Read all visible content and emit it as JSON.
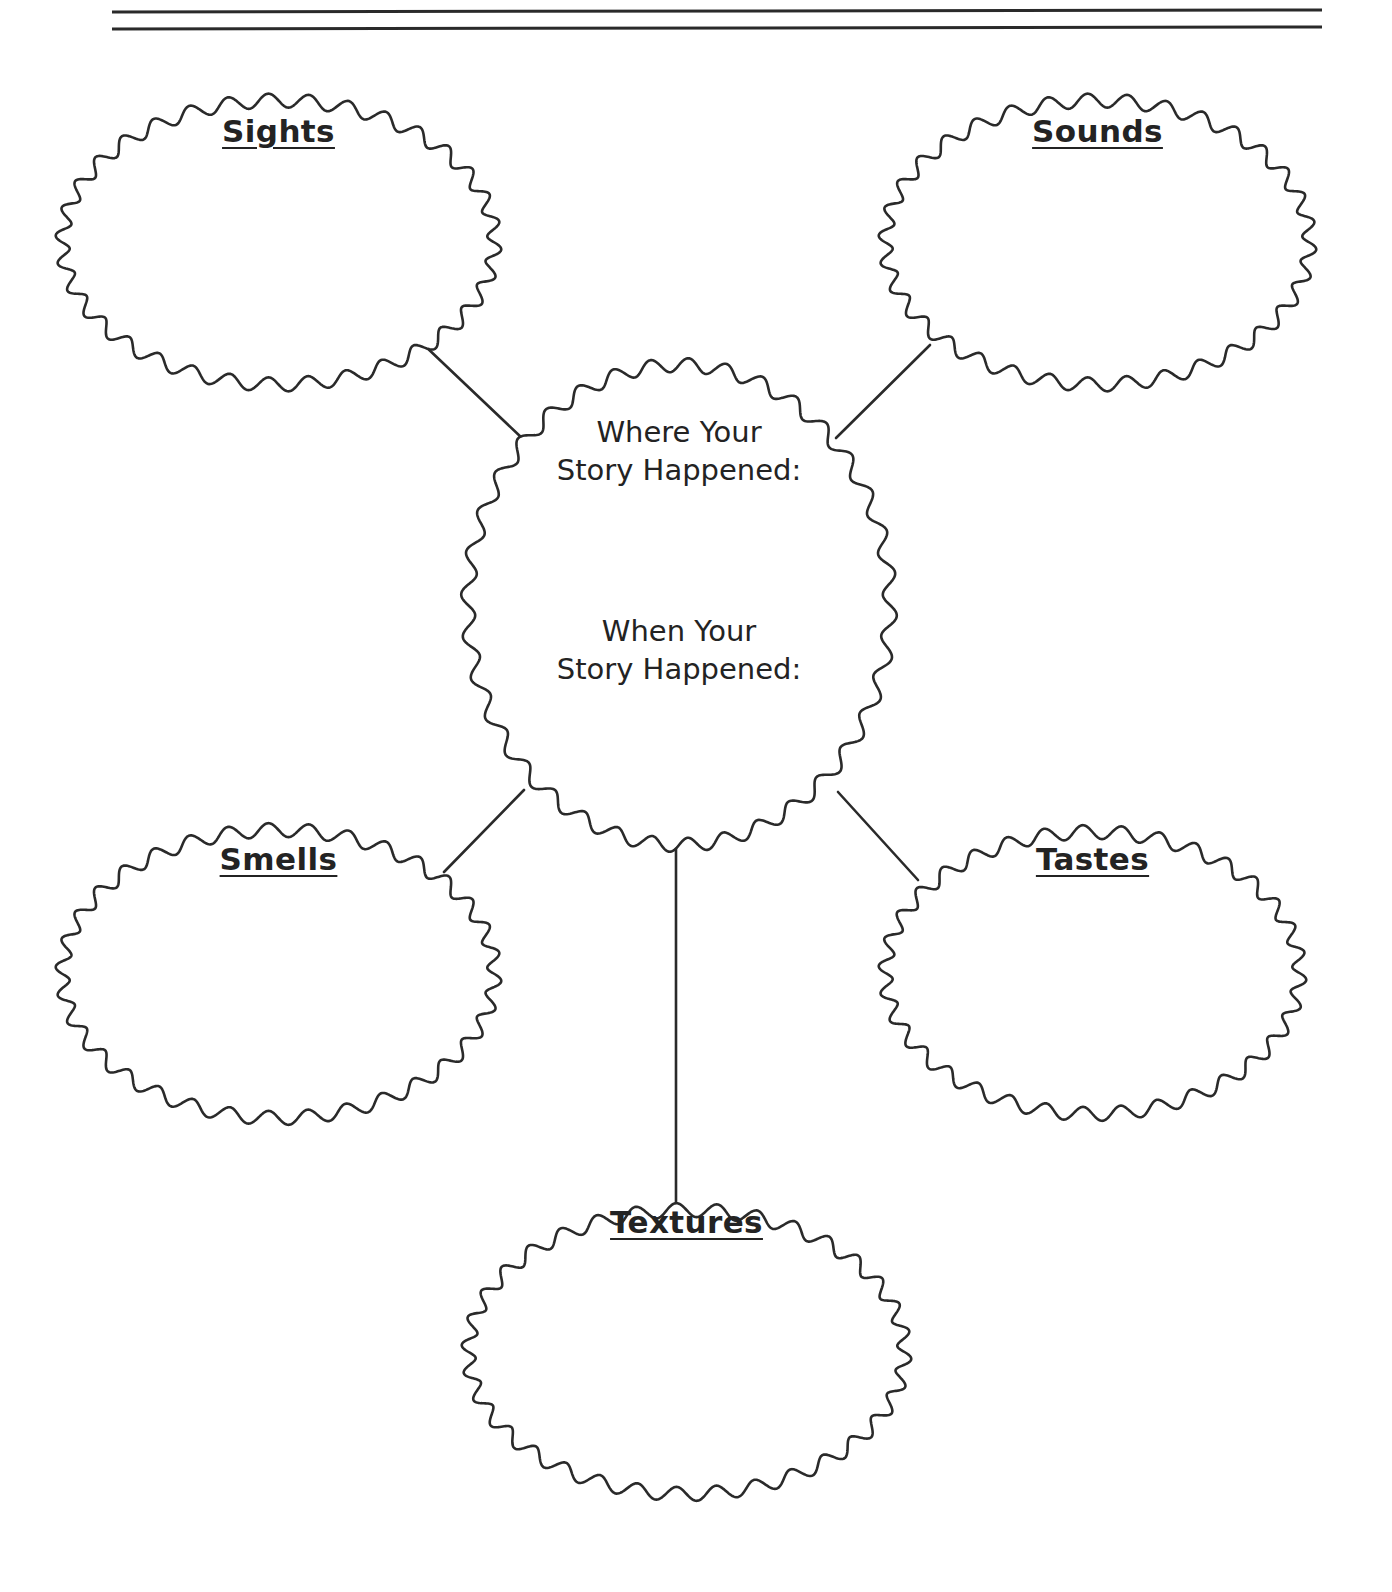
{
  "page": {
    "width": 1392,
    "height": 1592,
    "background_color": "#ffffff",
    "ink_color": "#2a2a2a",
    "text_color": "#232323"
  },
  "header": {
    "rule_name": "double-horizontal-rule",
    "rule_count": 2
  },
  "organizer": {
    "type": "sensory-details-web",
    "center": {
      "prompt_where": "Where Your\nStory Happened:",
      "prompt_when": "When Your\nStory Happened:"
    },
    "bubbles": [
      {
        "key": "sights",
        "label": "Sights",
        "position": "top-left"
      },
      {
        "key": "sounds",
        "label": "Sounds",
        "position": "top-right"
      },
      {
        "key": "smells",
        "label": "Smells",
        "position": "bottom-left"
      },
      {
        "key": "tastes",
        "label": "Tastes",
        "position": "bottom-right"
      },
      {
        "key": "textures",
        "label": "Textures",
        "position": "bottom-center"
      }
    ],
    "connectors": [
      {
        "from": "center",
        "to": "sights"
      },
      {
        "from": "center",
        "to": "sounds"
      },
      {
        "from": "center",
        "to": "smells"
      },
      {
        "from": "center",
        "to": "tastes"
      },
      {
        "from": "center",
        "to": "textures"
      }
    ]
  }
}
